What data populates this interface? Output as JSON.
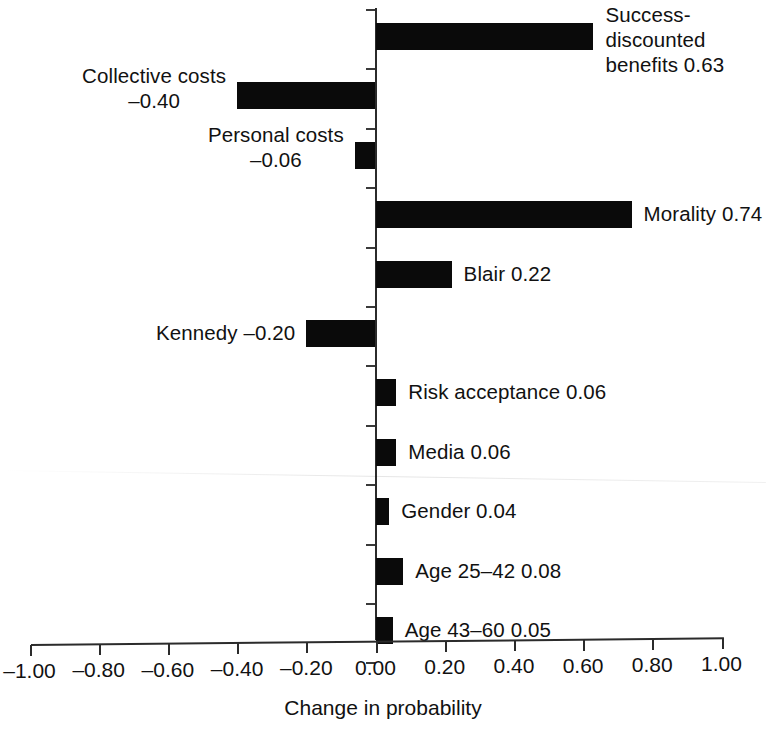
{
  "chart_data": {
    "type": "bar",
    "orientation": "horizontal",
    "title": "",
    "subtitle": "",
    "xlabel": "Change in probability",
    "ylabel": "",
    "xlim": [
      -1.0,
      1.0
    ],
    "grid": false,
    "legend": null,
    "xticks": [
      "-1.00",
      "-0.80",
      "-0.60",
      "-0.40",
      "-0.20",
      "0.00",
      "0.20",
      "0.40",
      "0.60",
      "0.80",
      "1.00"
    ],
    "xtick_values": [
      -1.0,
      -0.8,
      -0.6,
      -0.4,
      -0.2,
      0.0,
      0.2,
      0.4,
      0.6,
      0.8,
      1.0
    ],
    "categories": [
      "Success-discounted benefits",
      "Collective costs",
      "Personal costs",
      "Morality",
      "Blair",
      "Kennedy",
      "Risk acceptance",
      "Media",
      "Gender",
      "Age 25–42",
      "Age 43–60"
    ],
    "values": [
      0.63,
      -0.4,
      -0.06,
      0.74,
      0.22,
      -0.2,
      0.06,
      0.06,
      0.04,
      0.08,
      0.05
    ],
    "bars": [
      {
        "label_text": "Success-\ndiscounted\nbenefits 0.63",
        "value": 0.63,
        "side": "right"
      },
      {
        "label_text": "Collective costs\n–0.40",
        "value": -0.4,
        "side": "left"
      },
      {
        "label_text": "Personal costs\n–0.06",
        "value": -0.06,
        "side": "left"
      },
      {
        "label_text": "Morality 0.74",
        "value": 0.74,
        "side": "right"
      },
      {
        "label_text": "Blair 0.22",
        "value": 0.22,
        "side": "right"
      },
      {
        "label_text": "Kennedy –0.20",
        "value": -0.2,
        "side": "left"
      },
      {
        "label_text": "Risk acceptance 0.06",
        "value": 0.06,
        "side": "right"
      },
      {
        "label_text": "Media 0.06",
        "value": 0.06,
        "side": "right"
      },
      {
        "label_text": "Gender 0.04",
        "value": 0.04,
        "side": "right"
      },
      {
        "label_text": "Age 25–42 0.08",
        "value": 0.08,
        "side": "right"
      },
      {
        "label_text": "Age 43–60 0.05",
        "value": 0.05,
        "side": "right"
      }
    ],
    "bar_color": "#0a0a0a",
    "axis_color": "#2b2b2b"
  },
  "axis": {
    "x_title": "Change in probability"
  }
}
